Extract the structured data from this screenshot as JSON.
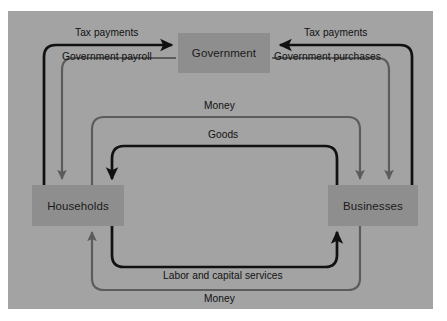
{
  "diagram": {
    "panel_color": "#a3a3a3",
    "node_color": "#8e8e8e",
    "flow_dark_color": "#111111",
    "flow_light_color": "#5c5c5c",
    "nodes": [
      {
        "id": "government",
        "label": "Government"
      },
      {
        "id": "households",
        "label": "Households"
      },
      {
        "id": "businesses",
        "label": "Businesses"
      }
    ],
    "flows": [
      {
        "id": "tax-payments-households",
        "label": "Tax payments",
        "from": "Households",
        "to": "Government",
        "style": "dark"
      },
      {
        "id": "government-payroll",
        "label": "Government payroll",
        "from": "Government",
        "to": "Households",
        "style": "light"
      },
      {
        "id": "tax-payments-businesses",
        "label": "Tax payments",
        "from": "Businesses",
        "to": "Government",
        "style": "dark"
      },
      {
        "id": "government-purchases",
        "label": "Government purchases",
        "from": "Government",
        "to": "Businesses",
        "style": "light"
      },
      {
        "id": "money-goods-payment",
        "label": "Money",
        "from": "Households",
        "to": "Businesses",
        "style": "light"
      },
      {
        "id": "goods",
        "label": "Goods",
        "from": "Businesses",
        "to": "Households",
        "style": "dark"
      },
      {
        "id": "labor-and-capital-services",
        "label": "Labor and capital services",
        "from": "Households",
        "to": "Businesses",
        "style": "dark"
      },
      {
        "id": "money-factor-payment",
        "label": "Money",
        "from": "Businesses",
        "to": "Households",
        "style": "light"
      }
    ]
  }
}
